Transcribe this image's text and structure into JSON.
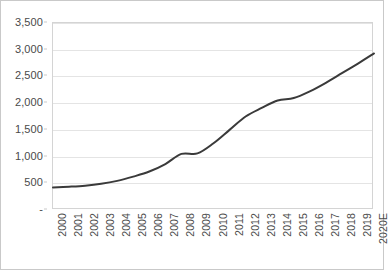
{
  "chart_data": {
    "type": "line",
    "title": "",
    "subtitle": "",
    "xlabel": "",
    "ylabel": "",
    "legend": [],
    "legend_position": "none",
    "grid": true,
    "grid_axis": "y",
    "ylim": [
      0,
      3500
    ],
    "y_tick_step": 500,
    "y_ticks": [
      0,
      500,
      1000,
      1500,
      2000,
      2500,
      3000,
      3500
    ],
    "y_tick_labels": [
      "-",
      "500",
      "1,000",
      "1,500",
      "2,000",
      "2,500",
      "3,000",
      "3,500"
    ],
    "categories": [
      "2000",
      "2001",
      "2002",
      "2003",
      "2004",
      "2005",
      "2006",
      "2007",
      "2008",
      "2009",
      "2010",
      "2011",
      "2012",
      "2013",
      "2014",
      "2015",
      "2016",
      "2017",
      "2018",
      "2019",
      "2020E"
    ],
    "values": [
      420,
      435,
      455,
      490,
      545,
      625,
      720,
      860,
      1050,
      1060,
      1250,
      1500,
      1750,
      1910,
      2050,
      2095,
      2220,
      2380,
      2560,
      2740,
      2930
    ],
    "series": [
      {
        "name": "",
        "color": "#3a3a3a",
        "values": [
          420,
          435,
          455,
          490,
          545,
          625,
          720,
          860,
          1050,
          1060,
          1250,
          1500,
          1750,
          1910,
          2050,
          2095,
          2220,
          2380,
          2560,
          2740,
          2930
        ]
      }
    ],
    "line_color": "#3a3a3a",
    "line_width": 2,
    "smooth": true,
    "markers": false
  },
  "style": {
    "background": "#ffffff",
    "border_color": "#c9c9c9",
    "plot_border_color": "#d4d4d4",
    "gridline_color": "#e4e4e4",
    "tick_text_color": "#4a4a4a"
  }
}
